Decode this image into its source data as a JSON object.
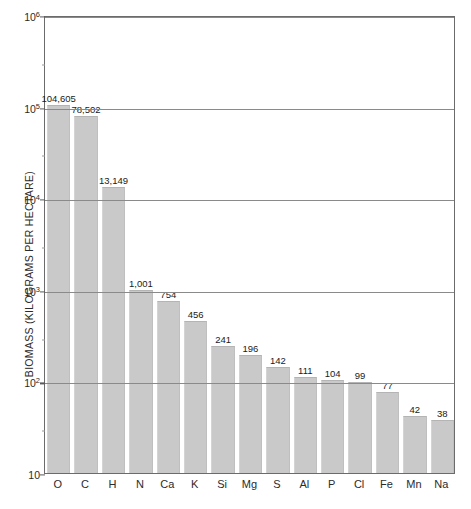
{
  "chart_data": {
    "type": "bar",
    "title": "",
    "xlabel": "",
    "ylabel": "BIOMASS (KILOGRAMS PER HECTARE)",
    "scale": "log",
    "ylim": [
      10,
      1000000
    ],
    "grid": true,
    "legend": false,
    "bar_color": "#c9c9c9",
    "axis_color": "#6b6b6b",
    "background": "#ffffff",
    "ytick_values": [
      10,
      100,
      1000,
      10000,
      100000,
      1000000
    ],
    "ytick_labels": [
      "10",
      "10²",
      "10³",
      "10⁴",
      "10⁵",
      "10⁶"
    ],
    "ytick_mantissa": [
      "10",
      "10",
      "10",
      "10",
      "10",
      "10"
    ],
    "ytick_exponent": [
      "",
      "2",
      "3",
      "4",
      "5",
      "6"
    ],
    "categories": [
      "O",
      "C",
      "H",
      "N",
      "Ca",
      "K",
      "Si",
      "Mg",
      "S",
      "Al",
      "P",
      "Cl",
      "Fe",
      "Mn",
      "Na"
    ],
    "values": [
      104605,
      78502,
      13149,
      1001,
      754,
      456,
      241,
      196,
      142,
      111,
      104,
      99,
      77,
      42,
      38
    ],
    "value_labels": [
      "104,605",
      "78,502",
      "13,149",
      "1,001",
      "754",
      "456",
      "241",
      "196",
      "142",
      "111",
      "104",
      "99",
      "77",
      "42",
      "38"
    ],
    "points": [
      {
        "category": "O",
        "value": 104605,
        "label": "104,605"
      },
      {
        "category": "C",
        "value": 78502,
        "label": "78,502"
      },
      {
        "category": "H",
        "value": 13149,
        "label": "13,149"
      },
      {
        "category": "N",
        "value": 1001,
        "label": "1,001"
      },
      {
        "category": "Ca",
        "value": 754,
        "label": "754"
      },
      {
        "category": "K",
        "value": 456,
        "label": "456"
      },
      {
        "category": "Si",
        "value": 241,
        "label": "241"
      },
      {
        "category": "Mg",
        "value": 196,
        "label": "196"
      },
      {
        "category": "S",
        "value": 142,
        "label": "142"
      },
      {
        "category": "Al",
        "value": 111,
        "label": "111"
      },
      {
        "category": "P",
        "value": 104,
        "label": "104"
      },
      {
        "category": "Cl",
        "value": 99,
        "label": "99"
      },
      {
        "category": "Fe",
        "value": 77,
        "label": "77"
      },
      {
        "category": "Mn",
        "value": 42,
        "label": "42"
      },
      {
        "category": "Na",
        "value": 38,
        "label": "38"
      }
    ]
  }
}
